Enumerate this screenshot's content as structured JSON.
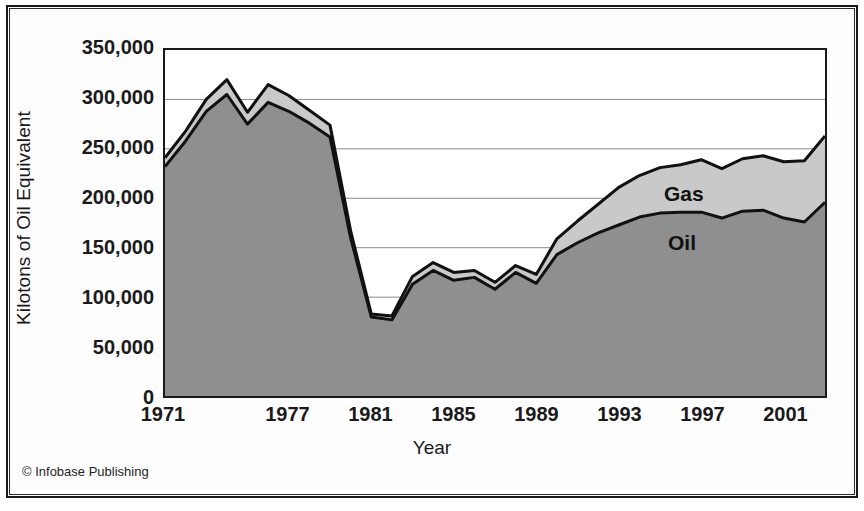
{
  "credit": "© Infobase Publishing",
  "chart_data": {
    "type": "area",
    "stacked": true,
    "title": "",
    "xlabel": "Year",
    "ylabel": "Kilotons of Oil Equivalent",
    "xlim": [
      1971,
      2003
    ],
    "ylim": [
      0,
      350000
    ],
    "grid": true,
    "legend_position": "in-plot",
    "ytick_labels": [
      "350,000",
      "300,000",
      "250,000",
      "200,000",
      "150,000",
      "100,000",
      "50,000",
      "0"
    ],
    "ytick_values": [
      350000,
      300000,
      250000,
      200000,
      150000,
      100000,
      50000,
      0
    ],
    "xtick_labels": [
      "1971",
      "1977",
      "1981",
      "1985",
      "1989",
      "1993",
      "1997",
      "2001"
    ],
    "xtick_values": [
      1971,
      1977,
      1981,
      1985,
      1989,
      1993,
      1997,
      2001
    ],
    "x": [
      1971,
      1972,
      1973,
      1974,
      1975,
      1976,
      1977,
      1978,
      1979,
      1980,
      1981,
      1982,
      1983,
      1984,
      1985,
      1986,
      1987,
      1988,
      1989,
      1990,
      1991,
      1992,
      1993,
      1994,
      1995,
      1996,
      1997,
      1998,
      1999,
      2000,
      2001,
      2002,
      2003
    ],
    "series": [
      {
        "name": "Oil",
        "color": "#8f8f8f",
        "values": [
          232000,
          258000,
          288000,
          305000,
          275000,
          297000,
          288000,
          276000,
          262000,
          160000,
          80000,
          77000,
          113000,
          127000,
          117000,
          120000,
          108000,
          125000,
          114000,
          143000,
          155000,
          165000,
          173000,
          181000,
          185000,
          186000,
          186000,
          180000,
          187000,
          188000,
          180000,
          176000,
          196000
        ]
      },
      {
        "name": "Gas",
        "color": "#c9c9c9",
        "values": [
          9000,
          10000,
          12000,
          15000,
          12000,
          18000,
          16000,
          13000,
          12000,
          7000,
          3000,
          4000,
          8000,
          8000,
          8000,
          7000,
          7000,
          7000,
          9000,
          16000,
          22000,
          29000,
          38000,
          42000,
          46000,
          48000,
          53000,
          50000,
          53000,
          55000,
          57000,
          62000,
          67000
        ]
      }
    ],
    "totals": [
      241000,
      268000,
      300000,
      320000,
      287000,
      315000,
      304000,
      289000,
      274000,
      167000,
      83000,
      81000,
      121000,
      135000,
      125000,
      127000,
      115000,
      132000,
      123000,
      159000,
      177000,
      194000,
      211000,
      223000,
      231000,
      234000,
      239000,
      230000,
      240000,
      243000,
      237000,
      238000,
      263000
    ]
  }
}
